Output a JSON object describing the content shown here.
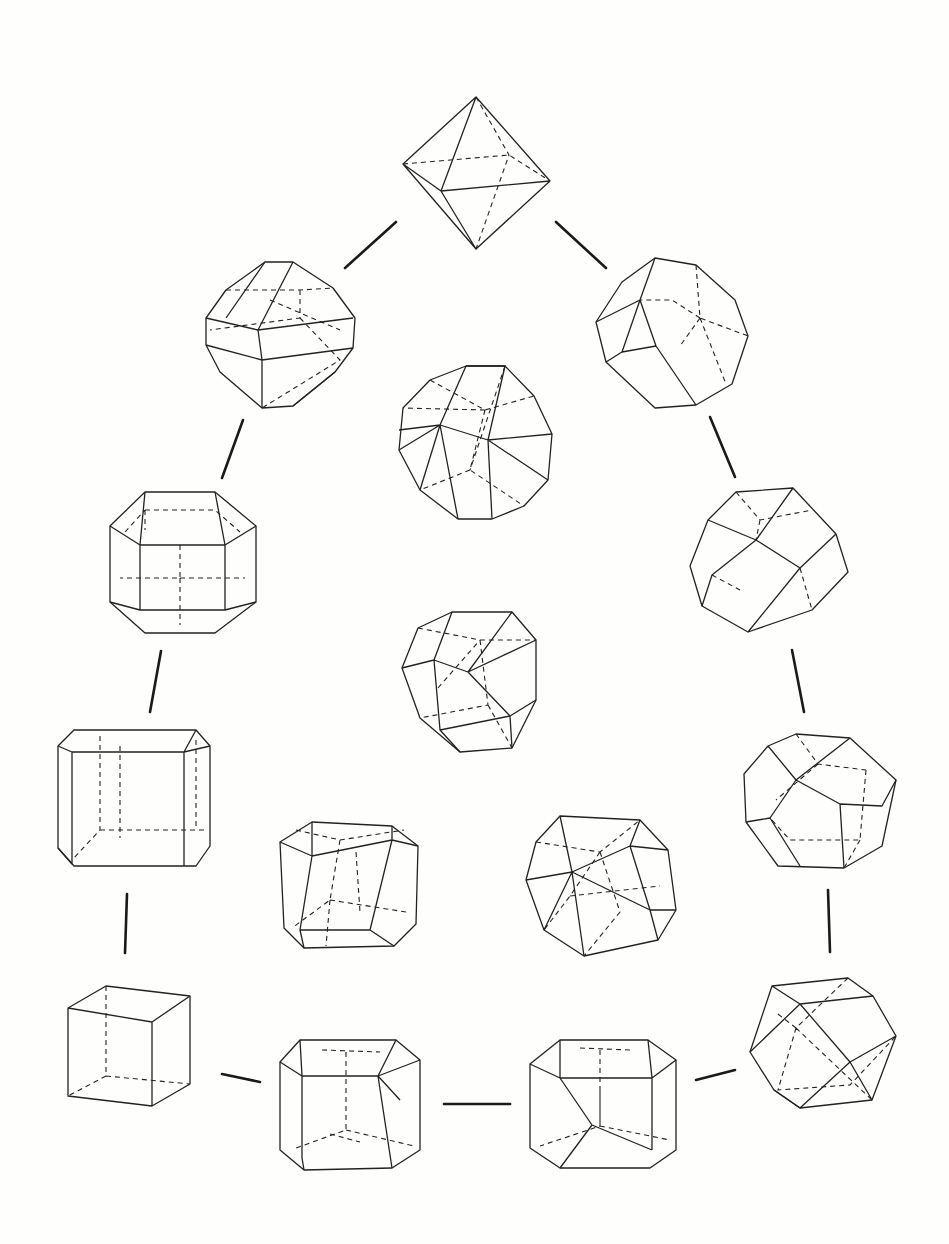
{
  "diagram": {
    "type": "crystal-form-transition-diagram",
    "background": "#fefefc",
    "stroke_color": "#222222",
    "nodes": [
      {
        "id": "octahedron",
        "name": "Octahedron",
        "cx": 476,
        "cy": 172
      },
      {
        "id": "trunc-oct-upper-left",
        "name": "Truncated octahedron (cube-modified)",
        "cx": 280,
        "cy": 335
      },
      {
        "id": "trapezo-upper-right",
        "name": "Octahedron modified by dodecahedron",
        "cx": 672,
        "cy": 333
      },
      {
        "id": "trisoctahedron-center",
        "name": "Trisoctahedron",
        "cx": 476,
        "cy": 442
      },
      {
        "id": "rhombicubo-left",
        "name": "Rhombicuboctahedron-like",
        "cx": 184,
        "cy": 562
      },
      {
        "id": "trunc-oct-right",
        "name": "Truncated octahedron",
        "cx": 770,
        "cy": 562
      },
      {
        "id": "icosi-center",
        "name": "Icositetrahedron-like",
        "cx": 467,
        "cy": 680
      },
      {
        "id": "trunc-cube-left",
        "name": "Cube with bevelled edges",
        "cx": 133,
        "cy": 798
      },
      {
        "id": "modified-right",
        "name": "Dodecahedron modified by cube",
        "cx": 820,
        "cy": 800
      },
      {
        "id": "tetrahexa-center-left",
        "name": "Tetrahexahedron",
        "cx": 350,
        "cy": 885
      },
      {
        "id": "hexoct-center-right",
        "name": "Hexoctahedron",
        "cx": 598,
        "cy": 885
      },
      {
        "id": "cube",
        "name": "Cube",
        "cx": 128,
        "cy": 1045
      },
      {
        "id": "trunc-cube-bottom",
        "name": "Cube modified by octahedron",
        "cx": 348,
        "cy": 1102
      },
      {
        "id": "cubo-bottom",
        "name": "Cube modified by dodecahedron",
        "cx": 604,
        "cy": 1102
      },
      {
        "id": "cuboctahedron",
        "name": "Cuboctahedron",
        "cx": 822,
        "cy": 1045
      }
    ],
    "connectors": [
      {
        "from": "octahedron",
        "to": "trunc-oct-upper-left",
        "x1": 345,
        "y1": 268,
        "x2": 396,
        "y2": 222
      },
      {
        "from": "octahedron",
        "to": "trapezo-upper-right",
        "x1": 556,
        "y1": 222,
        "x2": 606,
        "y2": 268
      },
      {
        "from": "trunc-oct-upper-left",
        "to": "rhombicubo-left",
        "x1": 243,
        "y1": 420,
        "x2": 222,
        "y2": 478
      },
      {
        "from": "trapezo-upper-right",
        "to": "trunc-oct-right",
        "x1": 710,
        "y1": 417,
        "x2": 735,
        "y2": 477
      },
      {
        "from": "rhombicubo-left",
        "to": "trunc-cube-left",
        "x1": 161,
        "y1": 651,
        "x2": 150,
        "y2": 712
      },
      {
        "from": "trunc-oct-right",
        "to": "modified-right",
        "x1": 792,
        "y1": 650,
        "x2": 804,
        "y2": 712
      },
      {
        "from": "trunc-cube-left",
        "to": "cube",
        "x1": 127,
        "y1": 894,
        "x2": 125,
        "y2": 953
      },
      {
        "from": "modified-right",
        "to": "cuboctahedron",
        "x1": 828,
        "y1": 890,
        "x2": 830,
        "y2": 952
      },
      {
        "from": "cube",
        "to": "trunc-cube-bottom",
        "x1": 222,
        "y1": 1074,
        "x2": 260,
        "y2": 1082
      },
      {
        "from": "trunc-cube-bottom",
        "to": "cubo-bottom",
        "x1": 444,
        "y1": 1104,
        "x2": 510,
        "y2": 1104
      },
      {
        "from": "cubo-bottom",
        "to": "cuboctahedron",
        "x1": 696,
        "y1": 1080,
        "x2": 735,
        "y2": 1070
      }
    ]
  }
}
